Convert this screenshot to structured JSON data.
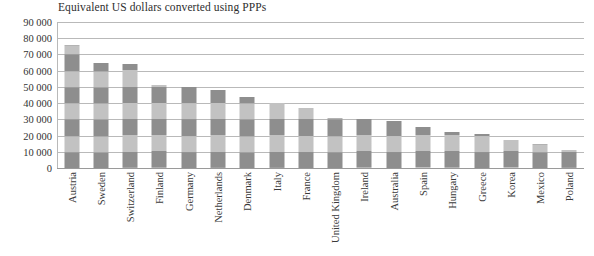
{
  "chart_data": {
    "type": "bar",
    "title": "Equivalent US dollars converted using PPPs",
    "xlabel": "",
    "ylabel": "",
    "ylim": [
      0,
      90000
    ],
    "ytick_step": 10000,
    "ytick_labels": [
      "90 000",
      "80 000",
      "70 000",
      "60 000",
      "50 000",
      "40 000",
      "30 000",
      "20 000",
      "10 000",
      "0"
    ],
    "ytick_values": [
      90000,
      80000,
      70000,
      60000,
      50000,
      40000,
      30000,
      20000,
      10000,
      0
    ],
    "grid": true,
    "legend": "none",
    "bar_fill_light": "#c2c2c2",
    "bar_fill_dark": "#8e8e8e",
    "gridline_color": "#b9b9b9",
    "categories": [
      "Austria",
      "Sweden",
      "Switzerland",
      "Finland",
      "Germany",
      "Netherlands",
      "Denmark",
      "Italy",
      "France",
      "United Kingdom",
      "Ireland",
      "Australia",
      "Spain",
      "Hungary",
      "Greece",
      "Korea",
      "Mexico",
      "Poland"
    ],
    "values": [
      76000,
      65000,
      64000,
      51000,
      50000,
      48000,
      44000,
      40000,
      37000,
      31000,
      30000,
      29000,
      25000,
      22000,
      21000,
      17000,
      15000,
      11000
    ]
  }
}
